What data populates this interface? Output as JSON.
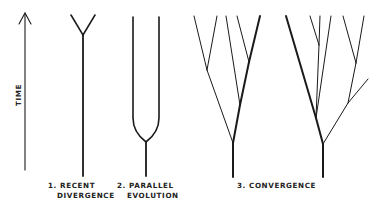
{
  "axis": {
    "label": "TIME",
    "direction": "up"
  },
  "panels": [
    {
      "id": "recent-divergence",
      "number": "1.",
      "line1": "1. RECENT",
      "line2": "DIVERGENCE"
    },
    {
      "id": "parallel-evolution",
      "number": "2.",
      "line1": "2. PARALLEL",
      "line2": "EVOLUTION"
    },
    {
      "id": "convergence",
      "number": "3.",
      "line1": "3. CONVERGENCE",
      "line2": ""
    }
  ],
  "colors": {
    "line": "#1a1a1a",
    "text": "#222222",
    "background": "#ffffff"
  }
}
